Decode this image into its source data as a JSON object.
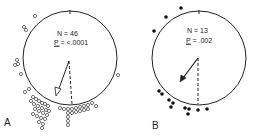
{
  "panels": [
    {
      "label": "A",
      "n_text": "N = 46",
      "p_text": "P = <.0001",
      "p_letter": "P",
      "p_rest": " = <.0001",
      "marker": "open-circle"
    },
    {
      "label": "B",
      "n_text": "N = 13",
      "p_text": "P = .002",
      "p_letter": "P",
      "p_rest": " = .002",
      "marker": "filled-circle"
    }
  ]
}
